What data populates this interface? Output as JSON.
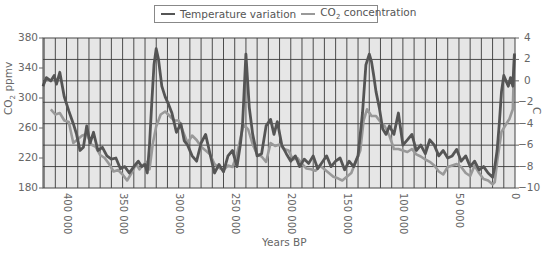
{
  "chart_data": {
    "type": "line",
    "title": "",
    "legend": {
      "position": "top-center",
      "entries": [
        {
          "label": "Temperature variation",
          "color": "#555555"
        },
        {
          "label": "CO2 concentration",
          "color": "#999999"
        }
      ]
    },
    "xlabel": "Years BP",
    "ylabel_left": "CO2 ppmv",
    "ylabel_right": "C",
    "x_axis": {
      "range": [
        421000,
        0
      ],
      "reversed": true,
      "ticks": [
        400000,
        350000,
        300000,
        250000,
        200000,
        150000,
        100000,
        50000,
        0
      ],
      "tick_labels": [
        "400 000",
        "350 000",
        "300 000",
        "250 000",
        "200 000",
        "150 000",
        "100 000",
        "50 000",
        "0"
      ]
    },
    "y_left": {
      "range": [
        180,
        380
      ],
      "ticks": [
        180,
        220,
        260,
        300,
        340,
        380
      ]
    },
    "y_right": {
      "range": [
        -10,
        4
      ],
      "ticks": [
        -10,
        -8,
        -6,
        -4,
        -2,
        0,
        2,
        4
      ]
    },
    "grid": true,
    "series": [
      {
        "name": "Temperature variation",
        "axis": "right",
        "color": "#555555",
        "x": [
          421000,
          418000,
          414000,
          411000,
          409000,
          406000,
          402000,
          398000,
          394000,
          391000,
          388000,
          385000,
          382000,
          379000,
          376000,
          372000,
          368000,
          364000,
          360000,
          356000,
          352000,
          348000,
          344000,
          340000,
          336000,
          333000,
          330000,
          328000,
          326000,
          324000,
          322000,
          320000,
          318000,
          315000,
          312000,
          309000,
          306000,
          302000,
          298000,
          295000,
          292000,
          288000,
          284000,
          280000,
          276000,
          272000,
          268000,
          264000,
          260000,
          256000,
          252000,
          248000,
          245000,
          243000,
          240000,
          237000,
          234000,
          230000,
          226000,
          222000,
          218000,
          215000,
          212000,
          208000,
          204000,
          200000,
          196000,
          192000,
          188000,
          184000,
          180000,
          176000,
          172000,
          168000,
          164000,
          160000,
          156000,
          152000,
          148000,
          144000,
          140000,
          136000,
          133000,
          130000,
          128000,
          126000,
          124000,
          121000,
          118000,
          115000,
          112000,
          108000,
          104000,
          100000,
          96000,
          92000,
          88000,
          84000,
          80000,
          76000,
          72000,
          68000,
          64000,
          60000,
          56000,
          52000,
          48000,
          44000,
          40000,
          36000,
          32000,
          28000,
          24000,
          20000,
          18000,
          16000,
          14000,
          12000,
          10000,
          8000,
          6000,
          4000,
          2000,
          500
        ],
        "values": [
          -0.5,
          0.3,
          0.0,
          0.5,
          -0.3,
          0.8,
          -1.5,
          -2.8,
          -4.0,
          -5.0,
          -6.5,
          -6.2,
          -4.2,
          -5.8,
          -4.8,
          -6.5,
          -6.2,
          -7.0,
          -7.3,
          -7.2,
          -8.2,
          -8.0,
          -8.6,
          -8.0,
          -7.5,
          -8.0,
          -7.8,
          -8.6,
          -6.0,
          -2.0,
          1.5,
          3.0,
          2.0,
          -0.5,
          -1.5,
          -2.2,
          -3.0,
          -4.8,
          -4.0,
          -5.6,
          -6.0,
          -7.0,
          -7.5,
          -5.8,
          -5.0,
          -6.8,
          -8.6,
          -7.8,
          -8.5,
          -7.0,
          -6.5,
          -8.0,
          -6.0,
          -4.0,
          2.5,
          -2.5,
          -5.0,
          -7.0,
          -6.8,
          -4.2,
          -3.6,
          -5.0,
          -3.8,
          -6.0,
          -6.8,
          -7.5,
          -7.0,
          -8.0,
          -7.3,
          -7.7,
          -7.0,
          -8.2,
          -7.6,
          -7.0,
          -8.0,
          -7.5,
          -7.2,
          -8.3,
          -7.5,
          -8.0,
          -7.0,
          -3.0,
          1.5,
          2.5,
          1.8,
          0.5,
          -1.0,
          -2.5,
          -4.5,
          -5.0,
          -4.2,
          -5.0,
          -3.0,
          -6.0,
          -5.5,
          -5.0,
          -6.5,
          -6.0,
          -6.8,
          -5.5,
          -6.0,
          -7.0,
          -6.5,
          -7.2,
          -7.0,
          -6.4,
          -7.5,
          -7.0,
          -8.0,
          -7.5,
          -8.3,
          -8.0,
          -8.6,
          -9.0,
          -8.0,
          -6.5,
          -4.0,
          -1.0,
          0.5,
          0.0,
          -0.5,
          0.3,
          -0.5,
          2.5
        ]
      },
      {
        "name": "CO2 concentration",
        "axis": "left",
        "color": "#999999",
        "x": [
          414000,
          410000,
          406000,
          402000,
          398000,
          394000,
          390000,
          386000,
          382000,
          378000,
          374000,
          370000,
          366000,
          362000,
          358000,
          354000,
          350000,
          346000,
          342000,
          338000,
          335000,
          332000,
          329000,
          326000,
          323000,
          320000,
          316000,
          312000,
          308000,
          304000,
          300000,
          296000,
          292000,
          288000,
          284000,
          280000,
          276000,
          272000,
          268000,
          264000,
          260000,
          256000,
          252000,
          248000,
          245000,
          242000,
          238000,
          234000,
          230000,
          226000,
          222000,
          218000,
          214000,
          210000,
          206000,
          202000,
          198000,
          194000,
          190000,
          186000,
          182000,
          178000,
          174000,
          170000,
          166000,
          162000,
          158000,
          154000,
          150000,
          146000,
          142000,
          138000,
          135000,
          132000,
          128000,
          124000,
          120000,
          116000,
          112000,
          108000,
          104000,
          100000,
          96000,
          92000,
          88000,
          84000,
          80000,
          76000,
          72000,
          68000,
          64000,
          60000,
          56000,
          52000,
          48000,
          44000,
          40000,
          36000,
          32000,
          28000,
          24000,
          20000,
          18000,
          16000,
          14000,
          12000,
          10000,
          8000,
          5000,
          2000,
          500
        ],
        "values": [
          285,
          278,
          280,
          270,
          268,
          240,
          245,
          250,
          252,
          238,
          235,
          224,
          220,
          212,
          202,
          204,
          198,
          190,
          200,
          212,
          205,
          210,
          215,
          205,
          240,
          262,
          278,
          282,
          276,
          270,
          270,
          255,
          240,
          250,
          244,
          235,
          230,
          225,
          212,
          207,
          204,
          210,
          208,
          225,
          245,
          265,
          258,
          238,
          225,
          222,
          215,
          240,
          236,
          238,
          232,
          230,
          218,
          220,
          212,
          206,
          205,
          203,
          210,
          205,
          200,
          195,
          193,
          190,
          195,
          200,
          215,
          230,
          270,
          285,
          276,
          276,
          268,
          262,
          250,
          232,
          232,
          230,
          228,
          232,
          225,
          222,
          218,
          215,
          210,
          202,
          198,
          208,
          210,
          212,
          208,
          200,
          196,
          210,
          200,
          192,
          190,
          185,
          188,
          215,
          235,
          255,
          260,
          265,
          272,
          285,
          360
        ]
      }
    ]
  },
  "legend": {
    "temperature_label": "Temperature variation",
    "co2_label_prefix": "CO",
    "co2_label_sub": "2",
    "co2_label_suffix": " concentration"
  },
  "axes": {
    "left_label_prefix": "CO",
    "left_label_sub": "2",
    "left_label_suffix": " ppmv",
    "right_label": "C",
    "x_label": "Years BP",
    "left_ticks": [
      "380",
      "340",
      "300",
      "260",
      "220",
      "180"
    ],
    "right_ticks": [
      "4",
      "2",
      "0",
      "−2",
      "−4",
      "−6",
      "−8",
      "−10"
    ],
    "x_ticks": [
      "400 000",
      "350 000",
      "300 000",
      "250 000",
      "200 000",
      "150 000",
      "100 000",
      "50 000",
      "0"
    ]
  },
  "colors": {
    "plot_background": "#e6e6e6",
    "grid": "#3a3a3a",
    "temperature": "#555555",
    "co2": "#999999"
  }
}
